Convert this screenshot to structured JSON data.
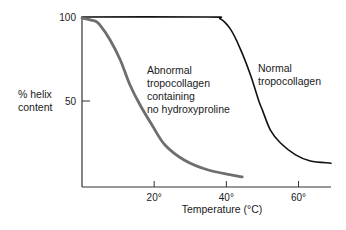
{
  "chart_data": {
    "type": "line",
    "title": "",
    "xlabel": "Temperature (°C)",
    "ylabel": [
      "% helix",
      "content"
    ],
    "xlim": [
      0,
      69
    ],
    "ylim": [
      0,
      100
    ],
    "grid": false,
    "legend": "none (inline annotations)",
    "x_ticks": [
      {
        "value": 20,
        "label": "20°"
      },
      {
        "value": 40,
        "label": "40°"
      },
      {
        "value": 60,
        "label": "60°"
      }
    ],
    "y_ticks": [
      {
        "value": 100,
        "label": "100"
      },
      {
        "value": 50,
        "label": "50"
      }
    ],
    "series": [
      {
        "name": "Normal tropocollagen",
        "label_lines": [
          "Normal",
          "tropocollagen"
        ],
        "color": "#111111",
        "x": [
          0,
          35,
          38.3,
          41.1,
          43.9,
          46.7,
          48.9,
          50.0,
          52.2,
          55.0,
          59.2,
          63.3,
          69.0
        ],
        "y": [
          100,
          100,
          99,
          92.9,
          80.9,
          65.5,
          50.6,
          44.6,
          32.7,
          25.0,
          17.9,
          14.3,
          13.0
        ]
      },
      {
        "name": "Abnormal tropocollagen containing no hydroxyproline",
        "label_lines": [
          "Abnormal",
          "tropocollagen",
          "containing",
          "no hydroxyproline"
        ],
        "color": "#6e6e6e",
        "x": [
          0,
          3.6,
          5.0,
          7.8,
          10.6,
          13.3,
          16.1,
          19.4,
          23.0,
          28.3,
          35.0,
          44.4
        ],
        "y": [
          99.4,
          97.6,
          95.2,
          86.3,
          74.4,
          59.5,
          47.6,
          35.7,
          23.8,
          14.9,
          8.9,
          4.8
        ]
      }
    ]
  }
}
